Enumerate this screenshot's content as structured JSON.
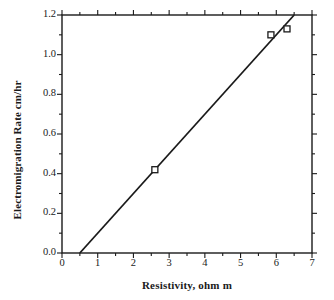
{
  "chart_data": {
    "type": "scatter",
    "title": "",
    "xlabel": "Resistivity, ohm m",
    "ylabel": "Electromigration Rate cm/hr",
    "xlim": [
      0,
      7
    ],
    "ylim": [
      0.0,
      1.2
    ],
    "xticks": [
      "0",
      "1",
      "2",
      "3",
      "4",
      "5",
      "6",
      "7"
    ],
    "xtick_values": [
      0,
      1,
      2,
      3,
      4,
      5,
      6,
      7
    ],
    "x_minor_step": 0.5,
    "yticks": [
      "0.0",
      "0.2",
      "0.4",
      "0.6",
      "0.8",
      "1.0",
      "1.2"
    ],
    "ytick_values": [
      0.0,
      0.2,
      0.4,
      0.6,
      0.8,
      1.0,
      1.2
    ],
    "y_minor_step": 0.1,
    "grid": false,
    "legend": null,
    "marker_style": "open-square",
    "marker_color": "#1a1a1a",
    "line_color": "#1a1a1a",
    "frame": true,
    "tick_direction": "out",
    "series": [
      {
        "name": "measured",
        "x": [
          2.6,
          5.85,
          6.3
        ],
        "y": [
          0.42,
          1.1,
          1.13
        ]
      },
      {
        "name": "fit-line",
        "type": "line",
        "x": [
          0.5,
          6.5
        ],
        "y": [
          0.0,
          1.2
        ],
        "slope": 0.2,
        "x_intercept": 0.5
      }
    ]
  }
}
